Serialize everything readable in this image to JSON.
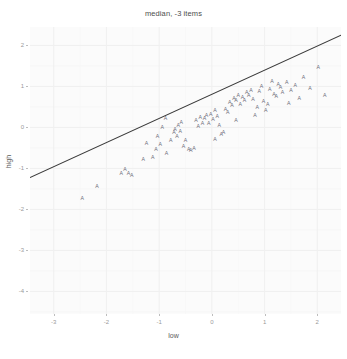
{
  "chart_data": {
    "type": "scatter",
    "title": "median, -3 items",
    "xlabel": "low",
    "ylabel": "high",
    "grid": true,
    "legend": false,
    "marker_glyph": "A",
    "xlim": [
      -3.45,
      2.45
    ],
    "ylim": [
      -4.55,
      2.45
    ],
    "xticks": [
      -3,
      -2,
      -1,
      0,
      1,
      2
    ],
    "xtick_labels": [
      "-3",
      "-2",
      "-1",
      "0",
      "1",
      "2"
    ],
    "yticks": [
      2,
      1,
      0,
      -1,
      -2,
      -3,
      -4
    ],
    "ytick_labels": [
      "2",
      "1",
      "0",
      "-1",
      "-2",
      "-3",
      "-4"
    ],
    "fit_line": {
      "type": "linear",
      "x0": -3.45,
      "y0": -1.22,
      "x1": 2.45,
      "y1": 2.25,
      "slope": 0.588,
      "intercept": 0.81
    },
    "points": [
      [
        -1.65,
        -1.02
      ],
      [
        -2.18,
        -1.42
      ],
      [
        -1.72,
        -1.12
      ],
      [
        -1.58,
        -1.1
      ],
      [
        -1.52,
        -1.16
      ],
      [
        -1.12,
        -0.72
      ],
      [
        -1.06,
        -0.52
      ],
      [
        -1.03,
        -0.2
      ],
      [
        -0.98,
        -0.4
      ],
      [
        -0.86,
        -0.62
      ],
      [
        -1.3,
        -0.78
      ],
      [
        -1.24,
        -0.38
      ],
      [
        -0.78,
        -0.3
      ],
      [
        -0.72,
        -0.12
      ],
      [
        -0.7,
        -0.04
      ],
      [
        -0.66,
        -0.22
      ],
      [
        -0.64,
        0.06
      ],
      [
        -0.6,
        -0.08
      ],
      [
        -0.58,
        0.14
      ],
      [
        -0.54,
        -0.46
      ],
      [
        -0.5,
        -0.3
      ],
      [
        -0.44,
        -0.52
      ],
      [
        -0.4,
        -0.54
      ],
      [
        -0.34,
        -0.5
      ],
      [
        -0.3,
        0.18
      ],
      [
        -0.26,
        0.04
      ],
      [
        -0.22,
        0.26
      ],
      [
        -0.18,
        0.1
      ],
      [
        -0.14,
        0.22
      ],
      [
        -0.1,
        0.3
      ],
      [
        -0.06,
        0.12
      ],
      [
        -0.02,
        0.34
      ],
      [
        0.02,
        0.2
      ],
      [
        0.06,
        0.42
      ],
      [
        0.1,
        0.28
      ],
      [
        0.14,
        0.06
      ],
      [
        0.18,
        -0.16
      ],
      [
        0.22,
        -0.1
      ],
      [
        0.26,
        0.46
      ],
      [
        0.3,
        0.38
      ],
      [
        0.34,
        0.62
      ],
      [
        0.38,
        0.54
      ],
      [
        0.42,
        0.72
      ],
      [
        0.46,
        0.66
      ],
      [
        0.5,
        0.8
      ],
      [
        0.54,
        0.58
      ],
      [
        0.58,
        0.74
      ],
      [
        0.62,
        0.68
      ],
      [
        0.66,
        0.86
      ],
      [
        0.7,
        0.78
      ],
      [
        0.74,
        0.92
      ],
      [
        0.78,
        0.7
      ],
      [
        0.82,
        0.3
      ],
      [
        0.86,
        0.5
      ],
      [
        0.9,
        0.88
      ],
      [
        0.94,
        1.02
      ],
      [
        0.98,
        0.64
      ],
      [
        1.02,
        0.42
      ],
      [
        1.06,
        0.56
      ],
      [
        1.1,
        0.94
      ],
      [
        1.14,
        1.14
      ],
      [
        1.18,
        0.82
      ],
      [
        1.22,
        0.76
      ],
      [
        1.26,
        1.06
      ],
      [
        1.3,
        0.98
      ],
      [
        1.34,
        0.86
      ],
      [
        1.42,
        1.1
      ],
      [
        1.5,
        0.92
      ],
      [
        1.58,
        1.04
      ],
      [
        1.66,
        0.72
      ],
      [
        1.74,
        1.22
      ],
      [
        1.86,
        0.96
      ],
      [
        2.02,
        1.48
      ],
      [
        2.14,
        0.78
      ],
      [
        -2.46,
        -1.72
      ],
      [
        -0.94,
        0.02
      ],
      [
        -0.88,
        0.22
      ],
      [
        0.06,
        -0.28
      ],
      [
        0.46,
        0.18
      ],
      [
        1.46,
        0.6
      ]
    ]
  },
  "axis": {
    "ytick_y_px": [
      38,
      89,
      128,
      169,
      198,
      241,
      285
    ],
    "xtick_x_px": [
      43,
      113,
      185,
      255,
      325
    ]
  },
  "colors": {
    "panel": "#fbfbfb",
    "grid_major": "#f0f0f0",
    "grid_minor": "#f6f6f6",
    "marker": "#6b6b78",
    "line": "#3a3a3a",
    "text": "#5a5a5a",
    "tick_text": "#9a9a9a"
  }
}
